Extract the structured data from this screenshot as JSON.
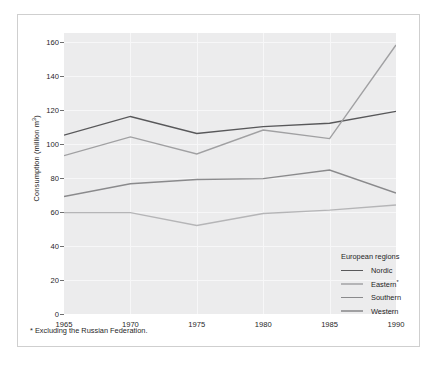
{
  "figure": {
    "ylabel_text": "Consumption (million m",
    "ylabel_sup": "3",
    "ylabel_tail": ")",
    "footnote": "* Excluding the Russian Federation."
  },
  "legend": {
    "title": "European regions",
    "entries": [
      {
        "label": "Nordic",
        "sup": "",
        "color": "#58585a"
      },
      {
        "label": "Eastern",
        "sup": "*",
        "color": "#b5b5b7"
      },
      {
        "label": "Southern",
        "sup": "",
        "color": "#8a8a8c"
      },
      {
        "label": "Western",
        "sup": "",
        "color": "#a0a0a2"
      }
    ]
  },
  "chart_data": {
    "type": "line",
    "title": "",
    "xlabel": "",
    "ylabel": "Consumption (million m3)",
    "x": [
      1965,
      1970,
      1975,
      1980,
      1985,
      1990
    ],
    "xticklabels": [
      "1965",
      "1970",
      "1975",
      "1980",
      "1985",
      "1990"
    ],
    "xlim": [
      1965,
      1990
    ],
    "ylim": [
      0,
      165
    ],
    "yticks": [
      0,
      20,
      40,
      60,
      80,
      100,
      120,
      140,
      160
    ],
    "yticklabels": [
      "0",
      "20",
      "40",
      "60",
      "80",
      "100",
      "120",
      "140",
      "160"
    ],
    "grid": true,
    "legend_position": "inside-lower-right",
    "series": [
      {
        "name": "Nordic",
        "color": "#58585a",
        "values": [
          105,
          116,
          106,
          110,
          112,
          119
        ]
      },
      {
        "name": "Eastern*",
        "color": "#b5b5b7",
        "values": [
          59.5,
          59.5,
          52,
          59,
          61,
          64
        ]
      },
      {
        "name": "Southern",
        "color": "#8a8a8c",
        "values": [
          69,
          76.5,
          79,
          79.5,
          84.5,
          71
        ]
      },
      {
        "name": "Western",
        "color": "#a0a0a2",
        "values": [
          93,
          104,
          94,
          108,
          103,
          158
        ]
      }
    ]
  }
}
